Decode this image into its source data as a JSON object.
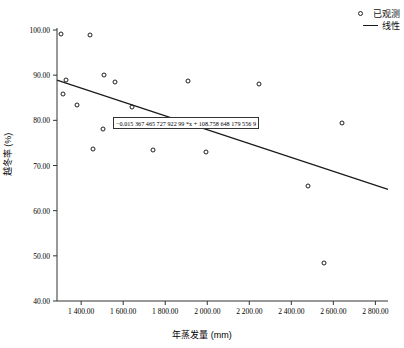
{
  "chart_data": {
    "type": "scatter",
    "title": "",
    "xlabel": "年蒸发量 (mm)",
    "ylabel": "越冬率 (%)",
    "xlim": [
      1285,
      2860
    ],
    "ylim": [
      40.0,
      100.0
    ],
    "grid": false,
    "legend_position": "top-right",
    "xticks": [
      1400,
      1600,
      1800,
      2000,
      2200,
      2400,
      2600,
      2800
    ],
    "xtick_labels": [
      "1 400.00",
      "1 600.00",
      "1 800.00",
      "2 000.00",
      "2 200.00",
      "2 400.00",
      "2 600.00",
      "2 800.00"
    ],
    "yticks": [
      40,
      50,
      60,
      70,
      80,
      90,
      100
    ],
    "ytick_labels": [
      "40.00",
      "50.00",
      "60.00",
      "70.00",
      "80.00",
      "90.00",
      "100.00"
    ],
    "series": [
      {
        "name": "已观测",
        "type": "scatter",
        "marker": "open-circle",
        "points": [
          {
            "x": 1305,
            "y": 99.1
          },
          {
            "x": 1330,
            "y": 88.9
          },
          {
            "x": 1315,
            "y": 85.9
          },
          {
            "x": 1380,
            "y": 83.4
          },
          {
            "x": 1440,
            "y": 98.8
          },
          {
            "x": 1455,
            "y": 73.6
          },
          {
            "x": 1510,
            "y": 90.0
          },
          {
            "x": 1505,
            "y": 78.1
          },
          {
            "x": 1560,
            "y": 88.5
          },
          {
            "x": 1640,
            "y": 82.9
          },
          {
            "x": 1740,
            "y": 73.5
          },
          {
            "x": 1910,
            "y": 88.8
          },
          {
            "x": 1995,
            "y": 73.0
          },
          {
            "x": 2245,
            "y": 88.1
          },
          {
            "x": 2480,
            "y": 65.4
          },
          {
            "x": 2555,
            "y": 48.5
          },
          {
            "x": 2640,
            "y": 79.4
          }
        ]
      },
      {
        "name": "线性",
        "type": "line",
        "equation_label": "−0.015 367 465 727 922 99 *x + 108.758 648 179 556 9",
        "slope": -0.01536746572792299,
        "intercept": 108.7586481795569,
        "endpoints": [
          {
            "x": 1285,
            "y": 88.9
          },
          {
            "x": 2860,
            "y": 64.7
          }
        ]
      }
    ]
  },
  "legend": {
    "items": [
      {
        "label": "已观测",
        "key": "open-circle-marker"
      },
      {
        "label": "线性",
        "key": "solid-line"
      }
    ]
  },
  "annotation": {
    "equation": "−0.015 367 465 727 922 99 *x + 108.758 648 179 556 9"
  }
}
